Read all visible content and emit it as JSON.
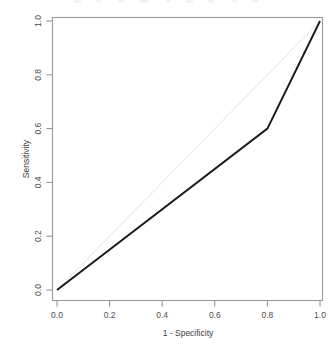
{
  "chart_data": {
    "type": "line",
    "title": "",
    "xlabel": "1 - Specificity",
    "ylabel": "Sensitivity",
    "xlim": [
      0,
      1
    ],
    "ylim": [
      0,
      1
    ],
    "grid": false,
    "legend": "none",
    "xticks": [
      "0.0",
      "0.2",
      "0.4",
      "0.6",
      "0.8",
      "1.0"
    ],
    "xtick_values": [
      0.0,
      0.2,
      0.4,
      0.6,
      0.8,
      1.0
    ],
    "yticks": [
      "0.0",
      "0.2",
      "0.4",
      "0.6",
      "0.8",
      "1.0"
    ],
    "ytick_values": [
      0.0,
      0.2,
      0.4,
      0.6,
      0.8,
      1.0
    ],
    "series": [
      {
        "name": "ROC curve",
        "color": "#181818",
        "x": [
          0.0,
          0.8,
          1.0
        ],
        "y": [
          0.0,
          0.6,
          1.0
        ]
      },
      {
        "name": "Reference diagonal",
        "color": "#eeeeee",
        "x": [
          0.0,
          1.0
        ],
        "y": [
          0.0,
          1.0
        ]
      }
    ]
  },
  "axes": {
    "x_title": "1 - Specificity",
    "y_title": "Sensitivity",
    "x_tick_labels": [
      "0.0",
      "0.2",
      "0.4",
      "0.6",
      "0.8",
      "1.0"
    ],
    "y_tick_labels": [
      "0.0",
      "0.2",
      "0.4",
      "0.6",
      "0.8",
      "1.0"
    ]
  },
  "colors": {
    "curve": "#181818",
    "reference": "#eeeeee",
    "frame": "#9a9a9a",
    "text": "#4d4d4d",
    "background": "#ffffff"
  }
}
